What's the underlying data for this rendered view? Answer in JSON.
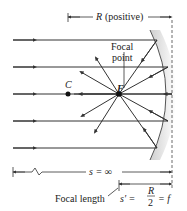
{
  "diagram": {
    "radius_label": "R",
    "radius_note": "(positive)",
    "focal_point_label_line1": "Focal",
    "focal_point_label_line2": "point",
    "focal_point_symbol": "F",
    "center_symbol": "C",
    "object_distance_label": "s = ∞",
    "focal_length_label": "Focal length",
    "image_distance_prefix": "s′ =",
    "fraction_numerator": "R",
    "fraction_denominator": "2",
    "image_distance_suffix": "= f",
    "colors": {
      "line": "#333333",
      "mirror_shade": "#d8d8d8"
    }
  }
}
